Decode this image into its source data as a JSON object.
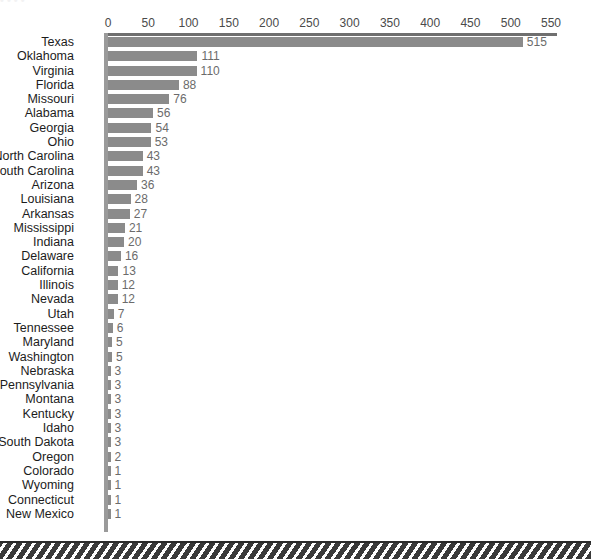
{
  "figure": {
    "top_clipped_text": "• •        • •",
    "background_color": "#ffffff",
    "bar_color": "#8b8b8b",
    "axis_color": "#6f6f6f",
    "label_color": "#1c1c1c",
    "value_color": "#6b6b6b"
  },
  "axis": {
    "ticks": [
      "0",
      "50",
      "100",
      "150",
      "200",
      "250",
      "300",
      "350",
      "400",
      "450",
      "500",
      "550"
    ],
    "tick_values": [
      0,
      50,
      100,
      150,
      200,
      250,
      300,
      350,
      400,
      450,
      500,
      550
    ]
  },
  "chart_data": {
    "type": "bar",
    "orientation": "horizontal",
    "title": "",
    "subtitle": "",
    "xlabel": "",
    "ylabel": "",
    "xlim": [
      0,
      550
    ],
    "grid": false,
    "legend": "none",
    "data_labels": true,
    "categories": [
      "Texas",
      "Oklahoma",
      "Virginia",
      "Florida",
      "Missouri",
      "Alabama",
      "Georgia",
      "Ohio",
      "North Carolina",
      "South Carolina",
      "Arizona",
      "Louisiana",
      "Arkansas",
      "Mississippi",
      "Indiana",
      "Delaware",
      "California",
      "Illinois",
      "Nevada",
      "Utah",
      "Tennessee",
      "Maryland",
      "Washington",
      "Nebraska",
      "Pennsylvania",
      "Montana",
      "Kentucky",
      "Idaho",
      "South Dakota",
      "Oregon",
      "Colorado",
      "Wyoming",
      "Connecticut",
      "New Mexico"
    ],
    "values": [
      515,
      111,
      110,
      88,
      76,
      56,
      54,
      53,
      43,
      43,
      36,
      28,
      27,
      21,
      20,
      16,
      13,
      12,
      12,
      7,
      6,
      5,
      5,
      3,
      3,
      3,
      3,
      3,
      3,
      2,
      1,
      1,
      1,
      1
    ],
    "value_labels": [
      "515",
      "111",
      "110",
      "88",
      "76",
      "56",
      "54",
      "53",
      "43",
      "43",
      "36",
      "28",
      "27",
      "21",
      "20",
      "16",
      "13",
      "12",
      "12",
      "7",
      "6",
      "5",
      "5",
      "3",
      "3",
      "3",
      "3",
      "3",
      "3",
      "2",
      "1",
      "1",
      "1",
      "1"
    ]
  }
}
